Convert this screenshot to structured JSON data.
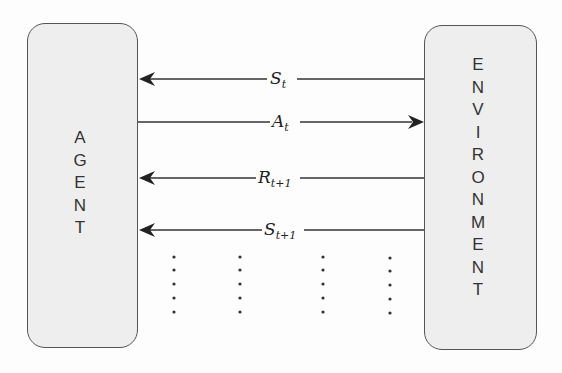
{
  "diagram": {
    "agent": {
      "label": "AGENT",
      "letters": [
        "A",
        "G",
        "E",
        "N",
        "T"
      ]
    },
    "environment": {
      "label": "ENVIRONMENT",
      "letters": [
        "E",
        "N",
        "V",
        "I",
        "R",
        "O",
        "N",
        "M",
        "E",
        "N",
        "T"
      ]
    },
    "arrows": [
      {
        "main": "S",
        "sub": "t",
        "direction": "to-agent"
      },
      {
        "main": "A",
        "sub": "t",
        "direction": "to-environment"
      },
      {
        "main": "R",
        "sub": "t+1",
        "direction": "to-agent"
      },
      {
        "main": "S",
        "sub": "t+1",
        "direction": "to-agent"
      }
    ],
    "continuation": "⋮"
  },
  "colors": {
    "box_fill": "#eeeeee",
    "box_border": "#555555",
    "line": "#333333"
  }
}
